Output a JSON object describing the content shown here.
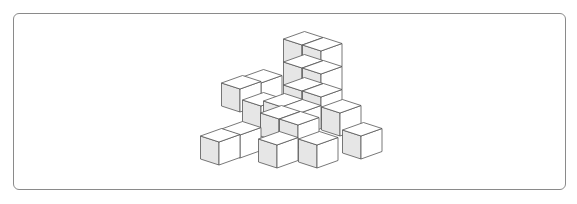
{
  "figure": {
    "type": "isometric-cube-arrangement",
    "cube_count_visible": 17,
    "colors": {
      "border": "#8a8a8a",
      "edge": "#555555",
      "shaded_face": "#e6e6e6",
      "light_face": "#ffffff"
    }
  }
}
